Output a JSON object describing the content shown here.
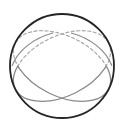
{
  "figure": {
    "name": "sphere-great-circles-diagram",
    "type": "geometric-line-diagram",
    "canvas": {
      "width": 124,
      "height": 137,
      "background": "#ffffff"
    }
  },
  "colors": {
    "outline": "#252525",
    "visible_arc": "#8a8a8a",
    "hidden_arc": "#a9a9a9",
    "background": "#ffffff"
  },
  "chart_data": {
    "type": "scatter",
    "title": "",
    "xlabel": "",
    "ylabel": "",
    "grid": false,
    "legend": null,
    "xlim": [
      0,
      124
    ],
    "ylim": [
      0,
      137
    ],
    "shapes": [
      {
        "name": "sphere-outline",
        "kind": "circle",
        "cx": 62,
        "cy": 66,
        "r": 52,
        "stroke": "#252525",
        "stroke_width": 1.8,
        "dashed": false
      },
      {
        "name": "great-circle-back-1",
        "kind": "ellipse",
        "cx": 62,
        "cy": 66,
        "rx": 52,
        "ry": 30,
        "rotation_deg": -26,
        "stroke": "#a9a9a9",
        "stroke_width": 1.2,
        "dashed": true,
        "dash_pattern": "3 2.5",
        "visible_portion": "upper"
      },
      {
        "name": "great-circle-back-2",
        "kind": "ellipse",
        "cx": 62,
        "cy": 66,
        "rx": 52,
        "ry": 30,
        "rotation_deg": 26,
        "stroke": "#a9a9a9",
        "stroke_width": 1.2,
        "dashed": true,
        "dash_pattern": "3 2.5",
        "visible_portion": "upper"
      },
      {
        "name": "great-circle-front-1",
        "kind": "ellipse",
        "cx": 62,
        "cy": 66,
        "rx": 52,
        "ry": 30,
        "rotation_deg": -26,
        "stroke": "#8a8a8a",
        "stroke_width": 1.3,
        "dashed": false,
        "visible_portion": "lower"
      },
      {
        "name": "great-circle-front-2",
        "kind": "ellipse",
        "cx": 62,
        "cy": 66,
        "rx": 52,
        "ry": 30,
        "rotation_deg": 26,
        "stroke": "#8a8a8a",
        "stroke_width": 1.3,
        "dashed": false,
        "visible_portion": "lower"
      }
    ],
    "intersections": [
      {
        "name": "upper-crossing",
        "x": 62,
        "y": 35
      },
      {
        "name": "lower-crossing",
        "x": 62,
        "y": 97
      },
      {
        "name": "left-convergence",
        "x": 12,
        "y": 66
      },
      {
        "name": "right-convergence",
        "x": 112,
        "y": 66
      }
    ],
    "labels": []
  }
}
